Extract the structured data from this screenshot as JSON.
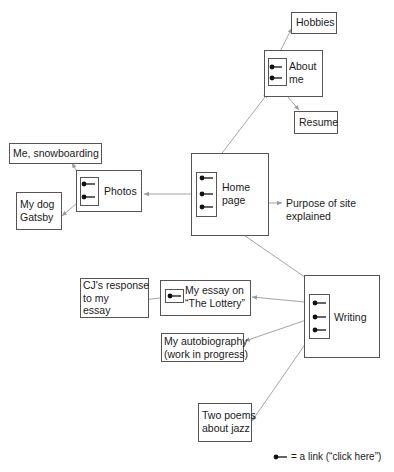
{
  "diagram": {
    "nodes": {
      "hobbies": {
        "label": "Hobbies"
      },
      "about": {
        "line1": "About",
        "line2": "me"
      },
      "resume": {
        "label": "Resume"
      },
      "snowboarding": {
        "label": "Me, snowboarding"
      },
      "photos": {
        "label": "Photos"
      },
      "gatsby": {
        "line1": "My dog",
        "line2": "Gatsby"
      },
      "home": {
        "line1": "Home",
        "line2": "page"
      },
      "purpose": {
        "line1": "Purpose of site",
        "line2": "explained"
      },
      "cj": {
        "line1": "CJ's response",
        "line2": "to my",
        "line3": "essay"
      },
      "essay": {
        "line1": "My essay on",
        "line2": "“The Lottery”"
      },
      "writing": {
        "label": "Writing"
      },
      "autobiography": {
        "line1": "My autobiography",
        "line2": "(work in progress)"
      },
      "poems": {
        "line1": "Two poems",
        "line2": "about jazz"
      }
    },
    "edges": [
      {
        "from": "home",
        "to": "about"
      },
      {
        "from": "home",
        "to": "photos"
      },
      {
        "from": "home",
        "to": "purpose",
        "bidirectional": true
      },
      {
        "from": "home",
        "to": "writing"
      },
      {
        "from": "about",
        "to": "hobbies"
      },
      {
        "from": "about",
        "to": "resume"
      },
      {
        "from": "photos",
        "to": "snowboarding"
      },
      {
        "from": "photos",
        "to": "gatsby"
      },
      {
        "from": "writing",
        "to": "essay"
      },
      {
        "from": "writing",
        "to": "autobiography"
      },
      {
        "from": "writing",
        "to": "poems"
      },
      {
        "from": "essay",
        "to": "cj"
      }
    ],
    "legend": {
      "text": "= a link (“click here”)"
    }
  }
}
